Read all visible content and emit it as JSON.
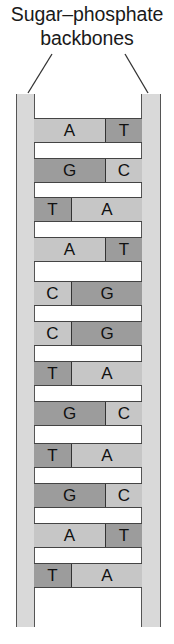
{
  "title": {
    "line1": "Sugar–phosphate",
    "line2": "backbones"
  },
  "colors": {
    "backbone": "#d9d9d9",
    "light_base": "#c6c6c6",
    "dark_base": "#9c9c9c",
    "outline": "#444444"
  },
  "base_shade": {
    "A": "light",
    "C": "light",
    "T": "dark",
    "G": "dark"
  },
  "pairs": [
    {
      "left": "A",
      "right": "T",
      "left_size": "long"
    },
    {
      "left": "G",
      "right": "C",
      "left_size": "long"
    },
    {
      "left": "T",
      "right": "A",
      "left_size": "short"
    },
    {
      "left": "A",
      "right": "T",
      "left_size": "long"
    },
    {
      "left": "C",
      "right": "G",
      "left_size": "short"
    },
    {
      "left": "C",
      "right": "G",
      "left_size": "short"
    },
    {
      "left": "T",
      "right": "A",
      "left_size": "short"
    },
    {
      "left": "G",
      "right": "C",
      "left_size": "long"
    },
    {
      "left": "T",
      "right": "A",
      "left_size": "short"
    },
    {
      "left": "G",
      "right": "C",
      "left_size": "long"
    },
    {
      "left": "A",
      "right": "T",
      "left_size": "long"
    },
    {
      "left": "T",
      "right": "A",
      "left_size": "short"
    }
  ]
}
